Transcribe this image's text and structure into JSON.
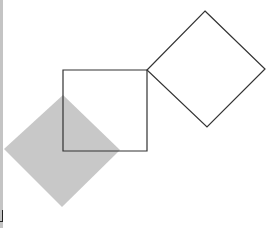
{
  "canvas": {
    "width": 275,
    "height": 228,
    "background": "#ffffff"
  },
  "colors": {
    "stroke": "#333333",
    "filled_shape": "#c8c8c8",
    "left_edge": "#c4c4c4"
  },
  "shapes": {
    "center_square": {
      "type": "square",
      "filled": false,
      "points": "63,70 147,70 147,151 63,151"
    },
    "right_diamond": {
      "type": "rotated-square",
      "filled": false,
      "points": "205,11 265,69 207,127 147,70"
    },
    "gray_diamond": {
      "type": "rotated-square",
      "filled": true,
      "points": "63,95 120,150 62,207 4,149"
    }
  }
}
